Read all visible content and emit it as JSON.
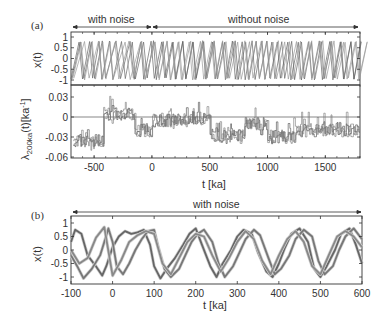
{
  "chart_data": [
    {
      "panel": "(a)",
      "type": "line",
      "subplots": [
        {
          "ylabel": "x(t)",
          "yticks": [
            "1",
            "0.5",
            "0",
            "-0.5",
            "-1"
          ],
          "ylim": [
            -1.2,
            1.2
          ],
          "series_description": "multiple overlaid sawtooth-like oscillating trajectories between -1 and 0.8",
          "annotations": [
            {
              "text": "with noise",
              "x_range": [
                -700,
                0
              ]
            },
            {
              "text": "without noise",
              "x_range": [
                0,
                1800
              ]
            }
          ]
        },
        {
          "ylabel": "λ200ka(t)[ka⁻¹]",
          "yticks": [
            "0.03",
            "0",
            "-0.03",
            "-0.06"
          ],
          "ylim": [
            -0.06,
            0.04
          ],
          "hline": 0,
          "series_description": "noisy step-like estimates, high around -400..-200 (up to ~0.03), negative (~-0.03) elsewhere"
        }
      ],
      "xlabel": "t [ka]",
      "xticks": [
        "-500",
        "0",
        "500",
        "1000",
        "1500"
      ],
      "xlim": [
        -700,
        1800
      ]
    },
    {
      "panel": "(b)",
      "type": "line",
      "ylabel": "x(t)",
      "yticks": [
        "1",
        "0.5",
        "0",
        "-0.5",
        "-1"
      ],
      "ylim": [
        -1.2,
        1.2
      ],
      "xlabel": "t [ka]",
      "xticks": [
        "-100",
        "0",
        "100",
        "200",
        "300",
        "400",
        "500",
        "600"
      ],
      "xlim": [
        -100,
        600
      ],
      "annotations": [
        {
          "text": "with noise",
          "x_range": [
            -100,
            600
          ]
        }
      ],
      "series": [
        {
          "name": "trajectory A",
          "x": [
            -100,
            -90,
            -75,
            -60,
            -40,
            -25,
            -15,
            0,
            15,
            30,
            45,
            60,
            75,
            90,
            100,
            115,
            130,
            150,
            170,
            185,
            200,
            215,
            235,
            250,
            265,
            285,
            300,
            315,
            335,
            350,
            370,
            385,
            400,
            415,
            430,
            450,
            470,
            485,
            500,
            515,
            535,
            550,
            570,
            585,
            600
          ],
          "values": [
            0.3,
            0.75,
            0.6,
            -0.2,
            -0.6,
            -0.95,
            -0.6,
            0.1,
            0.5,
            0.7,
            0.6,
            0.65,
            0.75,
            0.2,
            -0.6,
            -1.05,
            -0.7,
            -0.3,
            0.2,
            0.6,
            0.8,
            0.2,
            -0.6,
            -1.0,
            -0.5,
            0.0,
            0.5,
            0.75,
            0.6,
            -0.1,
            -0.8,
            -1.0,
            -0.5,
            0.1,
            0.6,
            0.8,
            0.3,
            -0.7,
            -1.0,
            -0.6,
            0.0,
            0.6,
            0.8,
            0.2,
            -0.5
          ]
        },
        {
          "name": "trajectory B",
          "x": [
            -100,
            -85,
            -70,
            -50,
            -30,
            -20,
            -10,
            0,
            10,
            25,
            40,
            55,
            70,
            85,
            100,
            110,
            125,
            140,
            160,
            175,
            190,
            205,
            220,
            240,
            255,
            270,
            290,
            305,
            320,
            340,
            355,
            375,
            390,
            405,
            425,
            440,
            460,
            480,
            495,
            510,
            530,
            545,
            560,
            580,
            600
          ],
          "values": [
            -0.2,
            -0.6,
            -1.05,
            -0.7,
            -0.2,
            0.3,
            0.8,
            0.3,
            -0.6,
            -0.9,
            -0.5,
            0.0,
            0.4,
            0.7,
            0.75,
            0.1,
            -0.7,
            -1.0,
            -0.7,
            -0.2,
            0.3,
            0.6,
            0.75,
            0.3,
            -0.5,
            -1.0,
            -0.6,
            -0.1,
            0.4,
            0.75,
            0.55,
            -0.3,
            -0.9,
            -0.7,
            -0.2,
            0.4,
            0.75,
            0.5,
            -0.4,
            -0.9,
            -0.6,
            0.0,
            0.5,
            0.8,
            0.4
          ]
        },
        {
          "name": "trajectory C",
          "x": [
            -100,
            -80,
            -60,
            -40,
            -20,
            0,
            20,
            40,
            60,
            80,
            100,
            120,
            140,
            160,
            180,
            200,
            220,
            240,
            260,
            280,
            300,
            320,
            340,
            360,
            380,
            400,
            420,
            440,
            460,
            480,
            500,
            520,
            540,
            560,
            580,
            600
          ],
          "values": [
            0.0,
            -0.5,
            -0.3,
            0.45,
            0.85,
            -0.95,
            -0.4,
            0.3,
            0.55,
            0.7,
            0.6,
            -0.5,
            -0.9,
            -0.3,
            0.3,
            0.6,
            0.5,
            -0.2,
            -0.8,
            -0.3,
            0.3,
            0.7,
            0.4,
            -0.4,
            -0.9,
            -0.2,
            0.4,
            0.7,
            0.3,
            -0.6,
            -0.9,
            -0.2,
            0.5,
            0.7,
            0.5,
            0.1
          ]
        }
      ]
    }
  ],
  "labels": {
    "panel_a": "(a)",
    "panel_b": "(b)",
    "with_noise": "with noise",
    "without_noise": "without noise",
    "with_noise_b": "with noise",
    "x_t": "x(t)",
    "lambda_main": "λ",
    "lambda_sub": "200ka",
    "lambda_rest": "(t)[ka",
    "lambda_sup": "-1",
    "lambda_close": "]",
    "xlabel_a": "t [ka]",
    "xlabel_b": "t [ka]"
  },
  "ticks": {
    "a_top_y": [
      "1",
      "0.5",
      "0",
      "-0.5",
      "-1"
    ],
    "a_bot_y": [
      "0.03",
      "0",
      "-0.03",
      "-0.06"
    ],
    "a_x": [
      "-500",
      "0",
      "500",
      "1000",
      "1500"
    ],
    "b_y": [
      "1",
      "0.5",
      "0",
      "-0.5",
      "-1"
    ],
    "b_x": [
      "-100",
      "0",
      "100",
      "200",
      "300",
      "400",
      "500",
      "600"
    ]
  }
}
